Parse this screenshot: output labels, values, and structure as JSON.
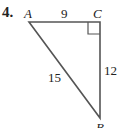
{
  "problem": {
    "number": "4.",
    "figure": {
      "type": "right-triangle",
      "vertices": [
        {
          "name": "A",
          "x": 29,
          "y": 22
        },
        {
          "name": "C",
          "x": 100,
          "y": 22
        },
        {
          "name": "B",
          "x": 100,
          "y": 118
        }
      ],
      "right_angle_at": "C",
      "sides": {
        "AC": "9",
        "CB": "12",
        "AB": "15"
      },
      "labels": {
        "A": "A",
        "B": "B",
        "C": "C"
      },
      "stroke_color": "#555555"
    }
  }
}
